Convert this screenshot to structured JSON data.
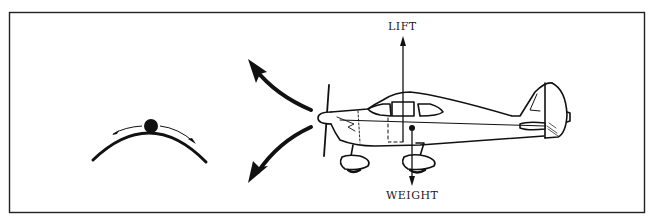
{
  "diagram": {
    "type": "stability-illustration",
    "labels": {
      "lift": "LIFT",
      "weight": "WEIGHT"
    },
    "elements": [
      {
        "id": "frame",
        "shape": "rectangle"
      },
      {
        "id": "ball-on-hill",
        "meaning": "ball balanced on convex surface with arrows showing it rolls away either side"
      },
      {
        "id": "pitch-up-arrow",
        "shape": "curved arrow pointing up-left"
      },
      {
        "id": "pitch-down-arrow",
        "shape": "curved arrow pointing down-left"
      },
      {
        "id": "airplane",
        "shape": "high-wing single-engine light airplane, side view"
      },
      {
        "id": "lift-vector",
        "direction": "up",
        "label": "LIFT"
      },
      {
        "id": "weight-vector",
        "direction": "down",
        "label": "WEIGHT"
      }
    ],
    "colors": {
      "ink": "#111111",
      "background": "#ffffff"
    }
  }
}
